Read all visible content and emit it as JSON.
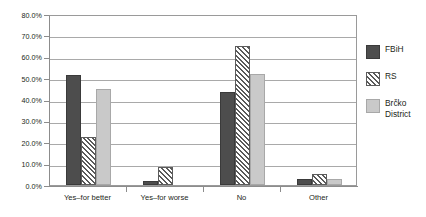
{
  "chart_data": {
    "type": "bar",
    "title": "",
    "xlabel": "",
    "ylabel": "",
    "ylim": [
      0,
      80
    ],
    "ytick_labels": [
      "80.0%",
      "70.0%",
      "60.0%",
      "50.0%",
      "40.0%",
      "30.0%",
      "20.0%",
      "10.0%",
      "0.0%"
    ],
    "ytick_values": [
      80,
      70,
      60,
      50,
      40,
      30,
      20,
      10,
      0
    ],
    "grid": true,
    "legend_position": "right",
    "categories": [
      "Yes–for better",
      "Yes–for worse",
      "No",
      "Other"
    ],
    "series": [
      {
        "name": "FBiH",
        "color": "#4d4d4d",
        "fill": "solid",
        "values": [
          51.5,
          2.0,
          43.5,
          3.0
        ]
      },
      {
        "name": "RS",
        "color": "#5a5a5a",
        "fill": "diagonal-hatch",
        "values": [
          22.5,
          8.5,
          65.0,
          5.0
        ]
      },
      {
        "name": "Brčko District",
        "color": "#c9c9c9",
        "fill": "solid",
        "values": [
          45.0,
          0.0,
          52.0,
          3.0
        ]
      }
    ]
  },
  "legend": {
    "items": [
      {
        "label": "FBiH"
      },
      {
        "label": "RS"
      },
      {
        "label": "Brčko District"
      }
    ]
  }
}
